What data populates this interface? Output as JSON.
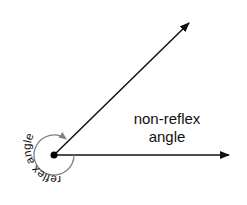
{
  "diagram": {
    "labels": {
      "non_reflex_line1": "non-reflex",
      "non_reflex_line2": "angle",
      "reflex": "reflex angle"
    },
    "colors": {
      "ray": "#111111",
      "arc": "#808080",
      "vertex": "#000000",
      "background": "#ffffff"
    },
    "vertex": {
      "x": 54,
      "y": 155
    },
    "rays": [
      {
        "name": "upper-ray",
        "end": {
          "x": 190,
          "y": 22
        }
      },
      {
        "name": "lower-ray",
        "end": {
          "x": 230,
          "y": 155
        }
      }
    ],
    "reflex_arc_radius": 20
  }
}
